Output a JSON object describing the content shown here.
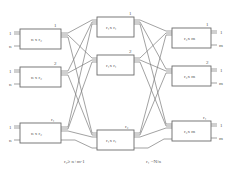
{
  "diagram": {
    "type": "three-stage Clos switching network",
    "stages": {
      "ingress": {
        "box_label": "n x r₂",
        "indices": [
          "1",
          "2",
          "r₁"
        ],
        "input_labels": {
          "top": "1",
          "bottom": "n"
        }
      },
      "middle": {
        "box_label": "r₁x r₁",
        "indices": [
          "1",
          "2",
          "r₂"
        ]
      },
      "egress": {
        "box_label": "r₂x m",
        "indices": [
          "1",
          "2",
          "r₁"
        ],
        "output_labels": {
          "top": "1",
          "bottom": "m"
        }
      }
    },
    "annotations": {
      "middle_count": "r₂≥ n+m-1",
      "outer_count": "r₁ =N/n"
    },
    "colors": {
      "line": "#7a7a7a",
      "box_border": "#6b6b6b",
      "text": "#555555",
      "background": "#ffffff"
    }
  }
}
